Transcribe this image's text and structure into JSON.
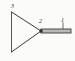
{
  "diagram": {
    "background_color": "#fbfbfa",
    "line_color": "#3b3b3b",
    "beam_fill_color": "#b8b8b8",
    "labels": [
      {
        "id": "label-3",
        "text": "3",
        "x": 11,
        "y": 3,
        "refers_to": "triangle-top-vertex"
      },
      {
        "id": "label-2",
        "text": "2",
        "x": 39,
        "y": 18,
        "refers_to": "triangle-right-joint"
      },
      {
        "id": "label-1",
        "text": "1",
        "x": 61,
        "y": 17,
        "refers_to": "horizontal-beam"
      }
    ],
    "shapes": {
      "triangle": {
        "type": "triangle",
        "vertices": [
          {
            "x": 11,
            "y": 12
          },
          {
            "x": 41,
            "y": 31
          },
          {
            "x": 11,
            "y": 52
          }
        ]
      },
      "beam": {
        "type": "double-line-beam",
        "x_start": 41,
        "x_end": 71,
        "y_top": 29,
        "y_bottom": 33
      },
      "joint": {
        "type": "pivot-dot",
        "x": 41,
        "y": 31,
        "radius": 1.6
      },
      "tick": {
        "type": "leader-tick",
        "x": 63,
        "y_start": 22,
        "y_end": 29
      }
    }
  }
}
